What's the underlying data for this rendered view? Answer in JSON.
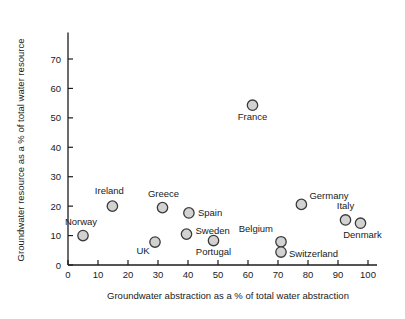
{
  "chart_data": {
    "type": "scatter",
    "title": "",
    "xlabel": "Groundwater abstraction as a % of total water abstraction",
    "ylabel": "Groundwater resource as a % of total water resource",
    "xlim": [
      0,
      103
    ],
    "ylim": [
      0,
      79
    ],
    "xticks": [
      0,
      10,
      20,
      30,
      40,
      50,
      60,
      70,
      80,
      90,
      100
    ],
    "yticks": [
      0,
      10,
      20,
      30,
      40,
      50,
      60,
      70
    ],
    "xtick_labels": [
      "0",
      "10",
      "20",
      "30",
      "40",
      "50",
      "60",
      "70",
      "80",
      "90",
      "100"
    ],
    "ytick_labels": [
      "0",
      "10",
      "20",
      "30",
      "40",
      "50",
      "60",
      "70"
    ],
    "grid": false,
    "legend": "none",
    "marker_fill": "#d2d2d2",
    "marker_stroke": "#3a3a3a",
    "marker_radius": 5.2,
    "points": [
      {
        "label": "Norway",
        "x": 5,
        "y": 10.0,
        "label_dx": -2,
        "label_dy": -11,
        "anchor": "middle"
      },
      {
        "label": "Ireland",
        "x": 14.8,
        "y": 20.0,
        "label_dx": -3,
        "label_dy": -12,
        "anchor": "middle"
      },
      {
        "label": "UK",
        "x": 29,
        "y": 7.8,
        "label_dx": -12,
        "label_dy": 12,
        "anchor": "middle"
      },
      {
        "label": "Greece",
        "x": 31.5,
        "y": 19.5,
        "label_dx": 1,
        "label_dy": -11,
        "anchor": "middle"
      },
      {
        "label": "Spain",
        "x": 40.3,
        "y": 17.7,
        "label_dx": 9,
        "label_dy": 3,
        "anchor": "start"
      },
      {
        "label": "Sweden",
        "x": 39.5,
        "y": 10.5,
        "label_dx": 9,
        "label_dy": 0,
        "anchor": "start"
      },
      {
        "label": "Portugal",
        "x": 48.5,
        "y": 8.3,
        "label_dx": 0,
        "label_dy": 14,
        "anchor": "middle"
      },
      {
        "label": "France",
        "x": 61.5,
        "y": 54.3,
        "label_dx": 0,
        "label_dy": 15,
        "anchor": "middle"
      },
      {
        "label": "Belgium",
        "x": 71,
        "y": 7.9,
        "label_dx": -8,
        "label_dy": -10,
        "anchor": "end"
      },
      {
        "label": "Switzerland",
        "x": 71,
        "y": 4.4,
        "label_dx": 8,
        "label_dy": 5,
        "anchor": "start"
      },
      {
        "label": "Germany",
        "x": 77.8,
        "y": 20.6,
        "label_dx": 8,
        "label_dy": -5,
        "anchor": "start"
      },
      {
        "label": "Italy",
        "x": 92.5,
        "y": 15.3,
        "label_dx": 0,
        "label_dy": -11,
        "anchor": "middle"
      },
      {
        "label": "Denmark",
        "x": 97.5,
        "y": 14.2,
        "label_dx": 2,
        "label_dy": 15,
        "anchor": "middle"
      }
    ]
  }
}
